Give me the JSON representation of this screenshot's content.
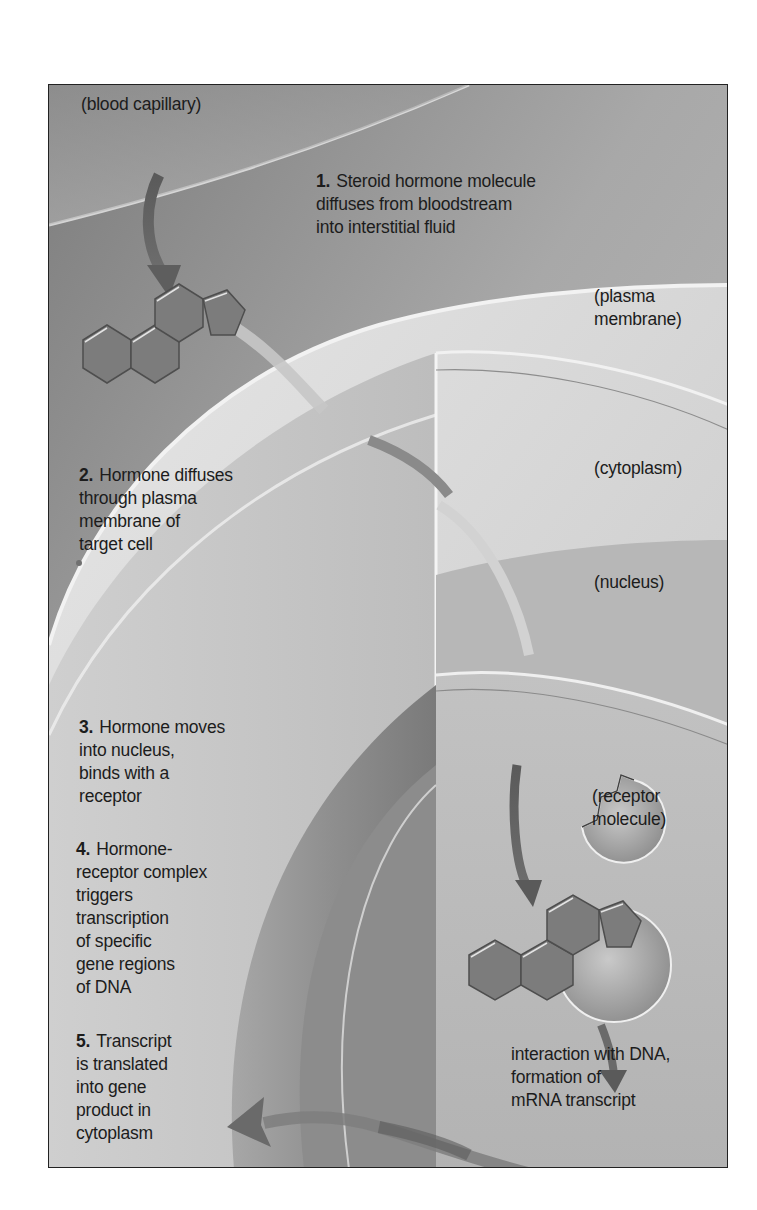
{
  "figure": {
    "labels": {
      "blood_capillary": "(blood capillary)",
      "plasma_membrane": "(plasma\nmembrane)",
      "cytoplasm": "(cytoplasm)",
      "nucleus": "(nucleus)",
      "receptor_molecule": "(receptor\nmolecule)",
      "dna_interaction": "interaction with DNA,\nformation of\nmRNA transcript"
    },
    "steps": [
      {
        "number": "1.",
        "text": "Steroid hormone molecule\ndiffuses from bloodstream\ninto interstitial fluid"
      },
      {
        "number": "2.",
        "text": "Hormone diffuses\nthrough plasma\nmembrane of\ntarget cell"
      },
      {
        "number": "3.",
        "text": "Hormone moves\ninto nucleus,\nbinds with a\nreceptor"
      },
      {
        "number": "4.",
        "text": "Hormone-\nreceptor complex\ntriggers\ntranscription\nof specific\ngene regions\nof DNA"
      },
      {
        "number": "5.",
        "text": "Transcript\nis translated\ninto gene\nproduct in\ncytoplasm"
      }
    ],
    "icons": [
      "steroid-molecule-icon",
      "receptor-molecule-icon",
      "hormone-receptor-complex-icon",
      "arrow-icon"
    ],
    "colors": {
      "background_dark": "#8a8a8a",
      "background_light": "#d8d8d8",
      "molecule_fill": "#7c7c7c",
      "arrow_fill": "#6a6a6a",
      "frame_border": "#222222",
      "text": "#1c1c1c"
    }
  }
}
